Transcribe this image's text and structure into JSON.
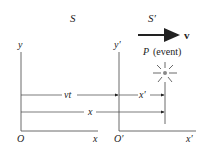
{
  "frames": {
    "s_label": "S",
    "s_prime_label": "S′"
  },
  "axes": {
    "s": {
      "y_label": "y",
      "x_label": "x",
      "origin_label": "O"
    },
    "s_prime": {
      "y_label": "y′",
      "x_label": "x′",
      "origin_label": "O′"
    }
  },
  "velocity": {
    "label": "v"
  },
  "event": {
    "label_italic": "P",
    "label_text": "(event)",
    "icon": "starburst-icon"
  },
  "distances": {
    "vt": "vt",
    "x_prime": "x′",
    "x": "x"
  },
  "colors": {
    "line": "#333333",
    "event_dot": "#888888",
    "background": "#ffffff"
  }
}
